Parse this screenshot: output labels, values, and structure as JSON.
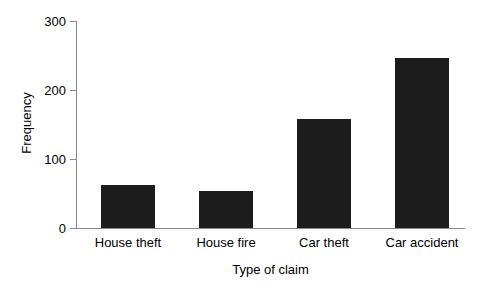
{
  "chart_data": {
    "type": "bar",
    "title": "",
    "subtitle": "",
    "categories": [
      "House theft",
      "House fire",
      "Car theft",
      "Car accident"
    ],
    "values": [
      63,
      53,
      158,
      247
    ],
    "xlabel": "Type of claim",
    "ylabel": "Frequency",
    "ylim": [
      0,
      300
    ],
    "yticks": [
      0,
      100,
      200,
      300
    ],
    "ytick_labels": [
      "0",
      "100",
      "200",
      "300"
    ],
    "grid": false,
    "legend": false,
    "legend_position": "none",
    "bar_color": "#1c1c1c",
    "axis_color": "#8b8b8b",
    "background_color": "#ffffff"
  },
  "axis_labels": {
    "y_title": "Frequency",
    "x_title": "Type of claim"
  },
  "ticks": {
    "y0": "0",
    "y1": "100",
    "y2": "200",
    "y3": "300"
  },
  "categories": {
    "c0": "House theft",
    "c1": "House fire",
    "c2": "Car theft",
    "c3": "Car accident"
  }
}
